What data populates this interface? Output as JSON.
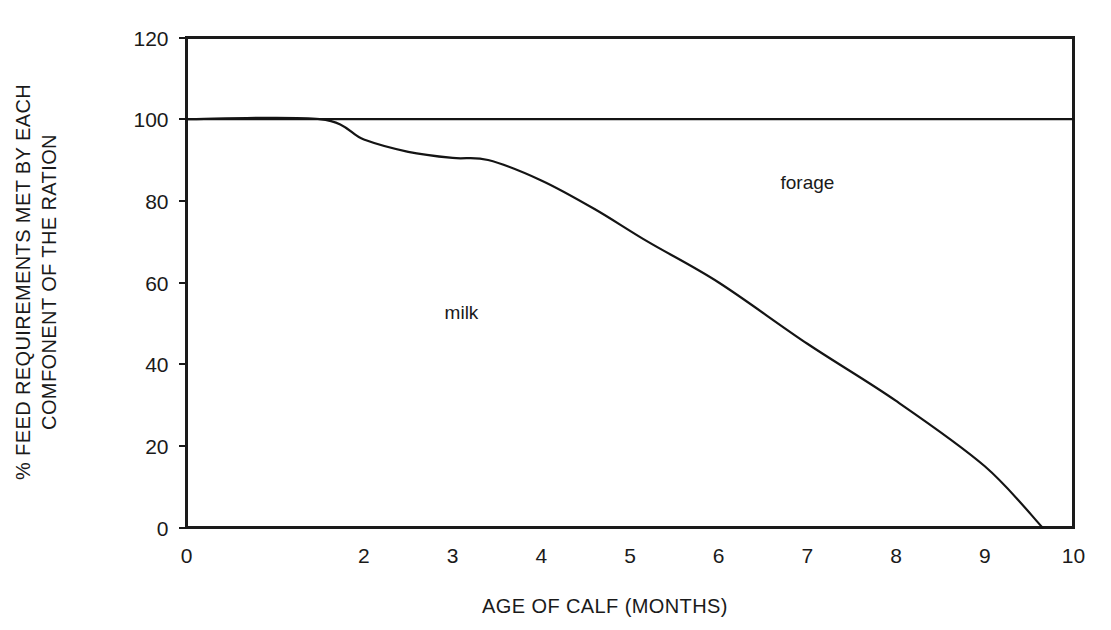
{
  "chart_data": {
    "type": "line",
    "title": "",
    "xlabel": "AGE OF CALF (MONTHS)",
    "ylabel": "% FEED REQUIREMENTS MET BY EACH COMFONENT OF THE RATION",
    "ylabel_line1": "% FEED REQUIREMENTS MET BY EACH",
    "ylabel_line2": "COMFONENT OF THE RATION",
    "xlim": [
      0,
      10
    ],
    "ylim": [
      0,
      120
    ],
    "grid": false,
    "legend_position": "inline-annotations",
    "x_ticks": [
      0,
      2,
      3,
      4,
      5,
      6,
      7,
      8,
      9,
      10
    ],
    "x_tick_labels": [
      "0",
      "2",
      "3",
      "4",
      "5",
      "6",
      "7",
      "8",
      "9",
      "10"
    ],
    "y_ticks": [
      0,
      20,
      40,
      60,
      80,
      100,
      120
    ],
    "y_tick_labels": [
      "0",
      "20",
      "40",
      "60",
      "80",
      "100",
      "120"
    ],
    "series": [
      {
        "name": "forage",
        "annotation": "forage",
        "annotation_x": 7.0,
        "annotation_y": 83,
        "color": "#141414",
        "points": [
          {
            "x": 0.0,
            "y": 100
          },
          {
            "x": 10.0,
            "y": 100
          }
        ]
      },
      {
        "name": "milk",
        "annotation": "milk",
        "annotation_x": 3.1,
        "annotation_y": 51,
        "color": "#141414",
        "points": [
          {
            "x": 0.0,
            "y": 100
          },
          {
            "x": 1.5,
            "y": 100
          },
          {
            "x": 2.0,
            "y": 95
          },
          {
            "x": 2.5,
            "y": 92
          },
          {
            "x": 3.0,
            "y": 90.5
          },
          {
            "x": 3.4,
            "y": 90
          },
          {
            "x": 4.0,
            "y": 85
          },
          {
            "x": 4.6,
            "y": 78
          },
          {
            "x": 5.2,
            "y": 70
          },
          {
            "x": 6.0,
            "y": 60
          },
          {
            "x": 7.0,
            "y": 45
          },
          {
            "x": 8.0,
            "y": 31
          },
          {
            "x": 9.0,
            "y": 15
          },
          {
            "x": 9.65,
            "y": 0
          }
        ]
      }
    ]
  },
  "labels": {
    "milk": "milk",
    "forage": "forage"
  },
  "axes": {
    "x_title": "AGE OF CALF (MONTHS)",
    "y_title_line1": "% FEED REQUIREMENTS MET BY EACH",
    "y_title_line2": "COMFONENT OF THE RATION"
  },
  "colors": {
    "line": "#141414",
    "axis": "#1a1a1a",
    "text": "#1a1a1a",
    "background": "#ffffff"
  }
}
